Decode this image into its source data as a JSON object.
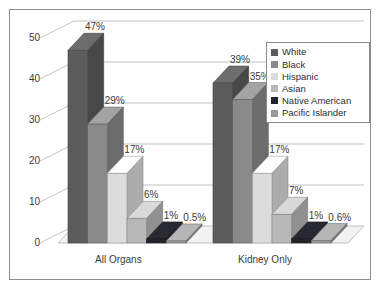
{
  "chart_data": {
    "type": "bar",
    "title": "",
    "subtitle": "",
    "xlabel": "",
    "ylabel": "",
    "categories": [
      "All Organs",
      "Kidney Only"
    ],
    "ylim": [
      0,
      50
    ],
    "yticks": [
      "0",
      "10",
      "20",
      "30",
      "40",
      "50"
    ],
    "grid": true,
    "legend_position": "top-right",
    "style": "3d-column",
    "series": [
      {
        "name": "White",
        "color": "#5c5c5c",
        "values": [
          47,
          39
        ],
        "labels": [
          "47%",
          "39%"
        ]
      },
      {
        "name": "Black",
        "color": "#8a8a8a",
        "values": [
          29,
          35
        ],
        "labels": [
          "29%",
          "35%"
        ]
      },
      {
        "name": "Hispanic",
        "color": "#dcdcdc",
        "values": [
          17,
          17
        ],
        "labels": [
          "17%",
          "17%"
        ]
      },
      {
        "name": "Asian",
        "color": "#b8b8b8",
        "values": [
          6,
          7
        ],
        "labels": [
          "6%",
          "7%"
        ]
      },
      {
        "name": "Native American",
        "color": "#23232a",
        "values": [
          1,
          1
        ],
        "labels": [
          "1%",
          "1%"
        ]
      },
      {
        "name": "Pacific Islander",
        "color": "#9a9a9a",
        "values": [
          0.5,
          0.6
        ],
        "labels": [
          "0.5%",
          "0.6%"
        ]
      }
    ]
  },
  "legend": {
    "items": [
      {
        "label": "White",
        "color": "#5c5c5c"
      },
      {
        "label": "Black",
        "color": "#8a8a8a"
      },
      {
        "label": "Hispanic",
        "color": "#dcdcdc"
      },
      {
        "label": "Asian",
        "color": "#b8b8b8"
      },
      {
        "label": "Native American",
        "color": "#23232a"
      },
      {
        "label": "Pacific Islander",
        "color": "#9a9a9a"
      }
    ]
  },
  "axis": {
    "y_ticks": [
      "50",
      "40",
      "30",
      "20",
      "10",
      "0"
    ],
    "x_categories": [
      "All Organs",
      "Kidney Only"
    ]
  },
  "value_labels": {
    "all_organs": [
      "47%",
      "29%",
      "17%",
      "6%",
      "1%",
      "0.5%"
    ],
    "kidney_only": [
      "39%",
      "35%",
      "17%",
      "7%",
      "1%",
      "0.6%"
    ]
  },
  "colors": {
    "frame_border": "#8e8e8e",
    "gridline": "#b4b4b4",
    "axis_text": "#3a3a3a",
    "background": "#ffffff",
    "floor": "#f2f2f2"
  }
}
